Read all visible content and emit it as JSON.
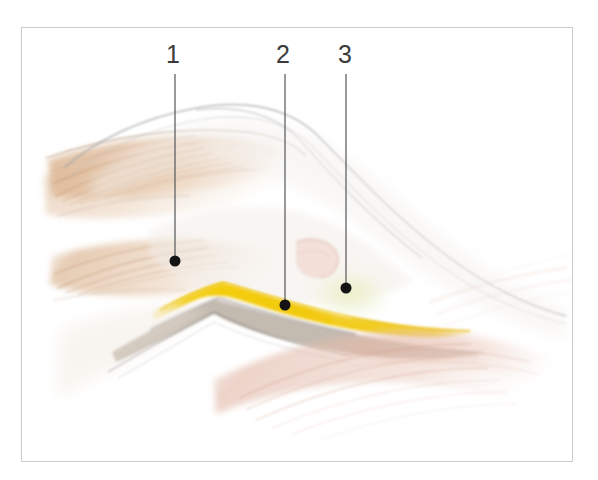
{
  "figure": {
    "kind": "anatomical-illustration",
    "style": "colored-pencil-watercolor",
    "background_color": "#ffffff",
    "frame": {
      "border_color": "#c9cbcd",
      "x": 21,
      "y": 27,
      "width": 552,
      "height": 435
    }
  },
  "callouts": [
    {
      "label": "1",
      "label_x": 166,
      "label_y": 42,
      "line_x": 175,
      "line_top": 74,
      "line_bottom": 259,
      "dot_x": 175,
      "dot_y": 261,
      "dot_r": 5.5,
      "target": "upper-muscle-belly"
    },
    {
      "label": "2",
      "label_x": 276,
      "label_y": 42,
      "line_x": 285,
      "line_top": 74,
      "line_bottom": 303,
      "dot_x": 285,
      "dot_y": 305,
      "dot_r": 5.5,
      "target": "yellow-nerve-band"
    },
    {
      "label": "3",
      "label_x": 338,
      "label_y": 42,
      "line_x": 346,
      "line_top": 74,
      "line_bottom": 286,
      "dot_x": 346,
      "dot_y": 288,
      "dot_r": 5.5,
      "target": "pale-yellow-green-fat-pad"
    }
  ],
  "colors": {
    "label_text": "#3b3b3d",
    "leader_line": "#5a5c5f",
    "dot": "#141414",
    "frame_border": "#c9cbcd",
    "nerve_yellow": "#f3cf1c",
    "nerve_yellow_deep": "#e8b90c",
    "muscle_tan": "#ddb894",
    "muscle_tan_light": "#ecd6bf",
    "muscle_pink": "#e5bdae",
    "muscle_pink_light": "#f0d6cc",
    "contour_gray": "#9a9a9c",
    "contour_gray_soft": "#bfbfc1",
    "shadow_brown": "#7a6047",
    "fat_pad_green": "#e9ecc4"
  }
}
